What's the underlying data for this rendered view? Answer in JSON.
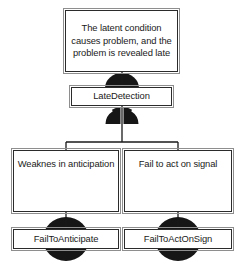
{
  "diagram": {
    "type": "fault-tree",
    "background_color": "#ffffff",
    "line_color": "#1a1a1a",
    "gate_fill_color": "#161616",
    "box_border_color": "#2b2b2b",
    "box_fill_color": "#ffffff",
    "nodes": [
      {
        "id": "top-event",
        "label": "The latent condition causes problem, and the problem is revealed late",
        "lines": [
          "The latent condition",
          "causes problem, and",
          "the problem is",
          "revealed late"
        ],
        "role": "top-event"
      },
      {
        "id": "late-detection",
        "label": "LateDetection",
        "lines": [
          "LateDetection"
        ],
        "role": "intermediate-event"
      },
      {
        "id": "weakness-anticipation",
        "label": "Weaknes in anticipation",
        "lines": [
          "Weaknes in",
          "anticipation"
        ],
        "role": "intermediate-event"
      },
      {
        "id": "fail-to-act-on-signal",
        "label": "Fail to act on signal",
        "lines": [
          "Fail to act on signal"
        ],
        "role": "intermediate-event"
      },
      {
        "id": "fail-to-anticipate",
        "label": "FailToAnticipate",
        "lines": [
          "FailToAnticipate"
        ],
        "role": "basic-event"
      },
      {
        "id": "fail-to-act-on-sign",
        "label": "FailToActOnSign",
        "lines": [
          "FailToActOnSign"
        ],
        "role": "basic-event"
      }
    ],
    "gates": [
      {
        "id": "gate-top",
        "shape": "dome",
        "between": [
          "top-event",
          "late-detection"
        ]
      },
      {
        "id": "gate-late-detection",
        "shape": "dome",
        "between": [
          "late-detection",
          "weakness-anticipation"
        ]
      },
      {
        "id": "gate-anticipate",
        "shape": "ellipse",
        "between": [
          "weakness-anticipation",
          "fail-to-anticipate"
        ]
      },
      {
        "id": "gate-actonsign",
        "shape": "ellipse",
        "between": [
          "fail-to-act-on-signal",
          "fail-to-act-on-sign"
        ]
      }
    ],
    "edges": [
      {
        "from": "top-event",
        "to": "late-detection"
      },
      {
        "from": "late-detection",
        "to": "weakness-anticipation"
      },
      {
        "from": "late-detection",
        "to": "fail-to-act-on-signal"
      },
      {
        "from": "weakness-anticipation",
        "to": "fail-to-anticipate"
      },
      {
        "from": "fail-to-act-on-signal",
        "to": "fail-to-act-on-sign"
      }
    ]
  }
}
